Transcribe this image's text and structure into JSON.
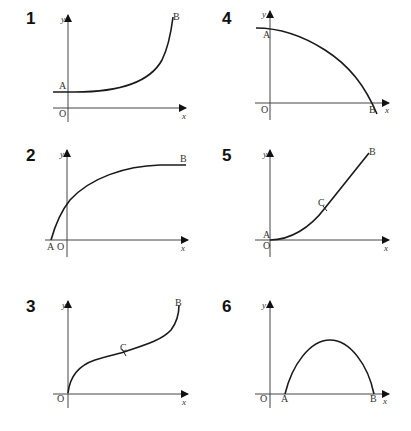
{
  "panels": [
    {
      "number": "1",
      "labels": {
        "A": "A",
        "B": "B",
        "O": "O",
        "x": "x",
        "y": "y"
      },
      "description": "exponential-like curve from A on y-axis rising steeply to B"
    },
    {
      "number": "2",
      "labels": {
        "A": "A",
        "B": "B",
        "O": "O",
        "x": "x",
        "y": "y"
      },
      "description": "logarithmic-like curve from A on negative x-axis rising and flattening to B"
    },
    {
      "number": "3",
      "labels": {
        "B": "B",
        "C": "C",
        "O": "O",
        "x": "x",
        "y": "y"
      },
      "description": "cubic-like curve from origin with inflection point C to B"
    },
    {
      "number": "4",
      "labels": {
        "A": "A",
        "B": "B",
        "O": "O",
        "x": "x",
        "y": "y"
      },
      "description": "concave-down curve from A on y-axis falling to B on x-axis"
    },
    {
      "number": "5",
      "labels": {
        "A": "A",
        "B": "B",
        "C": "C",
        "O": "O",
        "x": "x",
        "y": "y"
      },
      "description": "curve from A at origin, concave up to C then straight line to B"
    },
    {
      "number": "6",
      "labels": {
        "A": "A",
        "B": "B",
        "O": "O",
        "x": "x",
        "y": "y"
      },
      "description": "parabolic arch from A to B on x-axis"
    }
  ]
}
